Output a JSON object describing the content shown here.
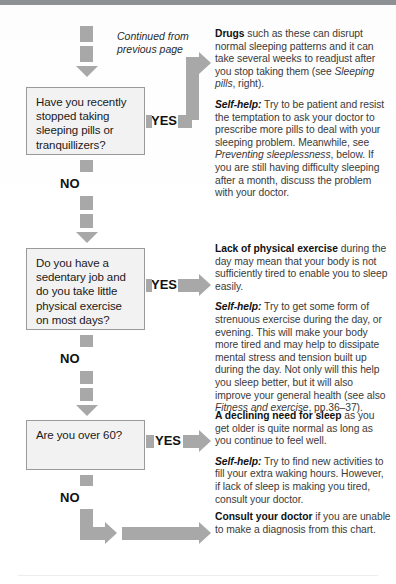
{
  "page": {
    "continued_note": "Continued from previous page",
    "yes_label": "YES",
    "no_label": "NO"
  },
  "questions": [
    {
      "id": "q-sleeping-pills",
      "text": "Have you recently stopped taking sleeping pills or tranquillizers?"
    },
    {
      "id": "q-sedentary-job",
      "text": "Do you have a sedentary job and do you take little physical exercise on most days?"
    },
    {
      "id": "q-over-60",
      "text": "Are you over 60?"
    }
  ],
  "answers": [
    {
      "id": "a-drugs",
      "lead": "Drugs",
      "lead_rest": " such as these can disrupt normal sleeping patterns and it can take several weeks to readjust after you stop taking them (see ",
      "ref": "Sleeping pills",
      "lead_tail": ", right).",
      "selfhelp_label": "Self-help:",
      "selfhelp_a": " Try to be patient and resist the temptation to ask your doctor to prescribe more pills to deal with your sleeping problem. Meanwhile, see ",
      "selfhelp_ref": "Preventing sleeplessness",
      "selfhelp_b": ", below. If you are still having difficulty sleeping after a month, discuss the problem with your doctor."
    },
    {
      "id": "a-exercise",
      "lead": "Lack of physical exercise",
      "lead_rest": " during the day may mean that your body is not sufficiently tired to enable you to sleep easily.",
      "selfhelp_label": "Self-help:",
      "selfhelp_a": " Try to get some form of strenuous exercise during the day, or evening. This will make your body more tired and may help to dissipate mental stress and tension built up during the day. Not only will this help you sleep better, but it will also improve your general health (see also ",
      "selfhelp_ref": "Fitness and exercise",
      "selfhelp_b": ", pp.36–37)."
    },
    {
      "id": "a-declining-sleep",
      "lead": "A declining need for sleep",
      "lead_rest": " as you get older is quite normal as long as you continue to feel well.",
      "selfhelp_label": "Self-help:",
      "selfhelp_a": " Try to find new activities to fill your extra waking hours. However, if lack of sleep is making you tired, consult your doctor."
    },
    {
      "id": "a-consult-doctor",
      "lead": "Consult your doctor",
      "lead_rest": " if you are unable to make a diagnosis from this chart."
    }
  ],
  "colors": {
    "connector": "#a8a8a8",
    "box_fill": "#f2f2f2",
    "box_border": "#9a9a9a",
    "top_band": "#8e9194",
    "text": "#3a3a3a"
  }
}
